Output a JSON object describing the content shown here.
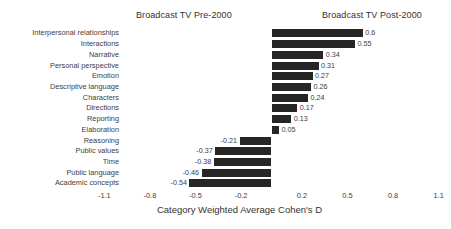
{
  "headers": {
    "left_panel": "Broadcast TV Pre-2000",
    "right_panel": "Broadcast TV Post-2000"
  },
  "chart_data": {
    "type": "bar",
    "orientation": "horizontal",
    "title": "",
    "subtitle": "",
    "xlabel": "Category Weighted Average Cohen's D",
    "ylabel": "",
    "xlim": [
      -1.25,
      1.25
    ],
    "xticks": [
      -1.1,
      -0.8,
      -0.5,
      -0.2,
      0.2,
      0.5,
      0.8,
      1.1
    ],
    "xticklabels": [
      "-1.1",
      "-0.8",
      "-0.5",
      "-0.2",
      "0.2",
      "0.5",
      "0.8",
      "1.1"
    ],
    "grid": false,
    "legend": false,
    "bar_color": "#262626",
    "background_color": "#ffffff",
    "zero_reference": 0,
    "categories": [
      "Interpersonal relationships",
      "Interactions",
      "Narrative",
      "Personal perspective",
      "Emotion",
      "Descriptive language",
      "Characters",
      "Directions",
      "Reporting",
      "Elaboration",
      "Reasoning",
      "Public values",
      "Time",
      "Public language",
      "Academic concepts"
    ],
    "values": [
      0.6,
      0.55,
      0.34,
      0.31,
      0.27,
      0.26,
      0.24,
      0.17,
      0.13,
      0.05,
      -0.21,
      -0.37,
      -0.38,
      -0.46,
      -0.54
    ],
    "value_labels": [
      "0.6",
      "0.55",
      "0.34",
      "0.31",
      "0.27",
      "0.26",
      "0.24",
      "0.17",
      "0.13",
      "0.05",
      "-0.21",
      "-0.37",
      "-0.38",
      "-0.46",
      "-0.54"
    ],
    "annotations": [
      {
        "text": "Broadcast TV Pre-2000",
        "side": "left"
      },
      {
        "text": "Broadcast TV Post-2000",
        "side": "right"
      }
    ]
  }
}
